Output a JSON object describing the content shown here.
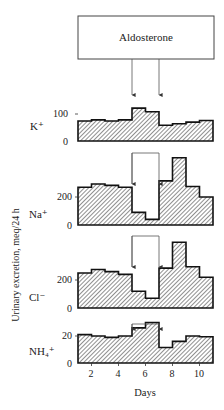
{
  "title_box": {
    "label": "Aldosterone"
  },
  "y_axis_label": "Urinary excretion, meq/24 h",
  "x_axis_label": "Days",
  "x_ticks": [
    "2",
    "4",
    "6",
    "8",
    "10"
  ],
  "panels": [
    {
      "ion": "K⁺",
      "tick_hi": "100",
      "tick_lo": "0"
    },
    {
      "ion": "Na⁺",
      "tick_hi": "200",
      "tick_lo": "0"
    },
    {
      "ion": "Cl⁻",
      "tick_hi": "200",
      "tick_lo": "0"
    },
    {
      "ion": "NH₄⁺",
      "tick_hi": "20",
      "tick_lo": "0"
    }
  ],
  "chart_data": {
    "type": "bar",
    "title": "Aldosterone",
    "xlabel": "Days",
    "ylabel": "Urinary excretion, meq/24 h",
    "categories": [
      1,
      2,
      3,
      4,
      5,
      6,
      7,
      8,
      9,
      10
    ],
    "x_ticks": [
      2,
      4,
      6,
      8,
      10
    ],
    "x_range": [
      1,
      11
    ],
    "aldosterone_period": [
      5,
      7
    ],
    "series": [
      {
        "name": "K+",
        "values": [
          74,
          78,
          74,
          78,
          122,
          108,
          58,
          64,
          70,
          76
        ],
        "ylim": [
          0,
          100
        ],
        "yticks": [
          0,
          100
        ]
      },
      {
        "name": "Na+",
        "values": [
          270,
          293,
          283,
          270,
          90,
          40,
          315,
          480,
          275,
          200
        ],
        "ylim": [
          0,
          200
        ],
        "yticks": [
          0,
          200
        ]
      },
      {
        "name": "Cl-",
        "values": [
          250,
          275,
          260,
          240,
          120,
          70,
          285,
          470,
          295,
          220
        ],
        "ylim": [
          0,
          200
        ],
        "yticks": [
          0,
          200
        ]
      },
      {
        "name": "NH4+",
        "values": [
          21,
          20,
          19,
          20,
          26,
          30,
          11.5,
          16,
          20,
          19.5
        ],
        "ylim": [
          0,
          20
        ],
        "yticks": [
          0,
          20
        ]
      }
    ],
    "style": {
      "fill": "diagonal-hatch",
      "step": true,
      "grid": false,
      "legend": "none"
    }
  }
}
